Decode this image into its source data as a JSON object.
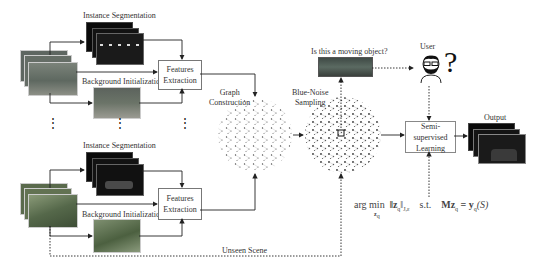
{
  "diagram": {
    "type": "pipeline-flowchart",
    "top_branch": {
      "instance_segmentation_label": "Instance Segmentation",
      "background_initialization_label": "Background Initialization",
      "features_box": {
        "line1": "Features",
        "line2": "Extraction"
      }
    },
    "bottom_branch": {
      "instance_segmentation_label": "Instance Segmentation",
      "background_initialization_label": "Background Initialization",
      "features_box": {
        "line1": "Features",
        "line2": "Extraction"
      }
    },
    "graph_construction_label": {
      "line1": "Graph",
      "line2": "Construction"
    },
    "blue_noise_label": {
      "line1": "Blue-Noise",
      "line2": "Sampling"
    },
    "question_label": "Is this a moving object?",
    "user_label": "User",
    "question_mark": "?",
    "ssl_box": {
      "line1": "Semi-supervised",
      "line2": "Learning"
    },
    "output_label": "Output",
    "unseen_scene_label": "Unseen Scene",
    "ellipsis": "⋮",
    "formula": {
      "argmin": "arg min",
      "argmin_sub": "z",
      "argmin_sub_q": "q",
      "norm": "‖z",
      "norm_q": "q",
      "norm_end": "‖",
      "norm_sub": "J,ε",
      "st": "s.t.",
      "rhs_M": "Mz",
      "rhs_q": "q",
      "eq": " = y",
      "rhs_y_q": "q",
      "rhs_S": "(S)"
    },
    "colors": {
      "line": "#222222",
      "box_border": "#777777",
      "dark_frame": "#0a0a0a",
      "photo_street": "#6e7468",
      "photo_park": "#56684a"
    }
  }
}
